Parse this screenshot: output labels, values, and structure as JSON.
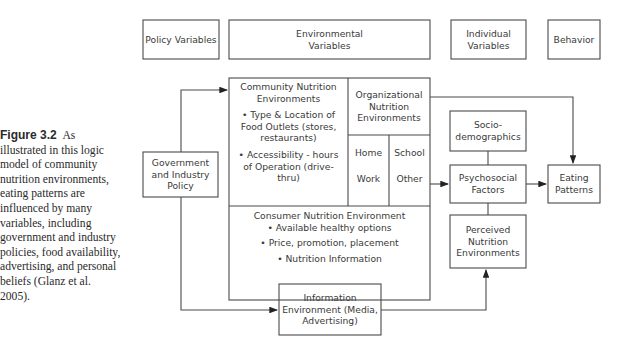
{
  "caption": {
    "figure_label": "Figure 3.2",
    "text": "As illustrated in this logic model of community nutrition environments, eating patterns are influenced by many variables, including government and industry policies, food availability, advertising, and personal beliefs (Glanz et al. 2005)."
  },
  "headers": {
    "policy": "Policy Variables",
    "environmental": "Environmental Variables",
    "individual": "Individual Variables",
    "behavior": "Behavior"
  },
  "boxes": {
    "government": "Government and Industry Policy",
    "community": {
      "title": "Community Nutrition Environments",
      "bullets": [
        "• Type & Location of Food Outlets (stores, restaurants)",
        "• Accessibility - hours of Operation (drive-thru)"
      ]
    },
    "organizational": {
      "title": "Organizational Nutrition Environments",
      "cells": [
        "Home",
        "School",
        "Work",
        "Other"
      ]
    },
    "consumer": {
      "title": "Consumer Nutrition Environment",
      "bullets": [
        "• Available healthy options",
        "• Price, promotion, placement",
        "• Nutrition Information"
      ]
    },
    "information": "Information Environment (Media, Advertising)",
    "sociodemographics": "Socio-demographics",
    "psychosocial": "Psychosocial Factors",
    "perceived": "Perceived Nutrition Environments",
    "eating": "Eating Patterns"
  },
  "colors": {
    "line": "#4a4a4a",
    "text": "#3a3a3a"
  }
}
